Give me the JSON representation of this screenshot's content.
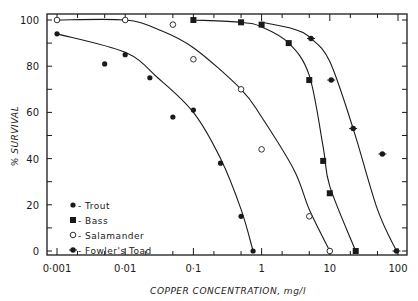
{
  "chart_data": {
    "type": "scatter",
    "title": "",
    "xlabel": "COPPER CONCENTRATION, mg/l",
    "ylabel": "% SURVIVAL",
    "xscale": "log",
    "xlim": [
      0.001,
      100
    ],
    "ylim": [
      0,
      100
    ],
    "x_ticks": [
      "0·001",
      "0·01",
      "0·1",
      "1",
      "10",
      "100"
    ],
    "x_tick_values": [
      0.001,
      0.01,
      0.1,
      1,
      10,
      100
    ],
    "y_ticks": [
      "0",
      "20",
      "40",
      "60",
      "80",
      "100"
    ],
    "y_tick_values": [
      0,
      20,
      40,
      60,
      80,
      100
    ],
    "grid": false,
    "legend_position": "lower-left",
    "series": [
      {
        "name": "Trout",
        "legend_label": "- Trout",
        "marker": "filled-circle",
        "x": [
          0.001,
          0.005,
          0.01,
          0.023,
          0.05,
          0.1,
          0.25,
          0.5,
          0.75
        ],
        "y": [
          94,
          81,
          85,
          75,
          58,
          61,
          38,
          15,
          0
        ],
        "curve": [
          [
            0.001,
            94
          ],
          [
            0.01,
            86
          ],
          [
            0.03,
            75
          ],
          [
            0.1,
            60
          ],
          [
            0.25,
            40
          ],
          [
            0.5,
            18
          ],
          [
            0.75,
            0
          ]
        ]
      },
      {
        "name": "Bass",
        "legend_label": "- Bass",
        "marker": "filled-square",
        "x": [
          0.1,
          0.5,
          1,
          2.5,
          5,
          8,
          10,
          24
        ],
        "y": [
          100,
          99,
          98,
          90,
          74,
          39,
          25,
          0
        ],
        "curve": [
          [
            0.1,
            100
          ],
          [
            0.5,
            99
          ],
          [
            1,
            97
          ],
          [
            2.5,
            90
          ],
          [
            5,
            76
          ],
          [
            8,
            45
          ],
          [
            10,
            28
          ],
          [
            24,
            0
          ]
        ]
      },
      {
        "name": "Salamander",
        "legend_label": "- Salamander",
        "marker": "open-circle",
        "x": [
          0.001,
          0.01,
          0.05,
          0.1,
          0.5,
          1,
          5,
          10
        ],
        "y": [
          100,
          100,
          98,
          83,
          70,
          44,
          15,
          0
        ],
        "curve": [
          [
            0.001,
            100
          ],
          [
            0.01,
            100
          ],
          [
            0.03,
            96
          ],
          [
            0.1,
            88
          ],
          [
            0.5,
            70
          ],
          [
            1,
            58
          ],
          [
            3,
            35
          ],
          [
            5,
            18
          ],
          [
            10,
            0
          ]
        ]
      },
      {
        "name": "Fowler's Toad",
        "legend_label": "- Fowler's  Toad",
        "marker": "filled-circle-star",
        "x": [
          5.3,
          10.5,
          22,
          59,
          95
        ],
        "y": [
          92,
          74,
          53,
          42,
          0
        ],
        "curve": [
          [
            1,
            99
          ],
          [
            3,
            96
          ],
          [
            5.3,
            92
          ],
          [
            10,
            82
          ],
          [
            22,
            53
          ],
          [
            50,
            18
          ],
          [
            95,
            0
          ]
        ]
      }
    ]
  }
}
